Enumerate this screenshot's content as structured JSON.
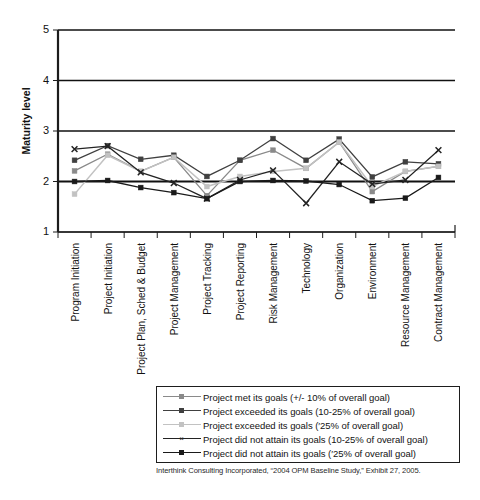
{
  "chart_data": {
    "type": "line",
    "title": "",
    "xlabel": "",
    "ylabel": "Maturity level",
    "ylim": [
      1,
      5
    ],
    "yticks": [
      1,
      2,
      3,
      4,
      5
    ],
    "grid": true,
    "grid_axis": "y",
    "legend_position": "below-plot",
    "categories": [
      "Program Initiation",
      "Project Initiation",
      "Project Plan, Sched & Budget",
      "Project Management",
      "Project Tracking",
      "Project Reporting",
      "Risk Management",
      "Technology",
      "Organization",
      "Environment",
      "Resource Management",
      "Contract Management"
    ],
    "series": [
      {
        "name": "Project met its goals (+/- 10% of overall goal)",
        "color": "#8a8a8a",
        "marker": "square",
        "values": [
          2.21,
          2.54,
          2.2,
          2.48,
          1.72,
          2.42,
          2.62,
          2.26,
          2.78,
          1.8,
          2.2,
          2.3
        ]
      },
      {
        "name": "Project exceeded its goals (10-25% of overall goal)",
        "color": "#404040",
        "marker": "square",
        "values": [
          2.42,
          2.71,
          2.44,
          2.52,
          2.1,
          2.42,
          2.85,
          2.42,
          2.84,
          2.09,
          2.39,
          2.35
        ]
      },
      {
        "name": "Project exceeded its goals (>25% of overall goal)",
        "color": "#c2c2c2",
        "marker": "square",
        "values": [
          1.75,
          2.52,
          2.2,
          2.48,
          1.9,
          2.1,
          2.2,
          2.26,
          2.78,
          1.9,
          2.2,
          2.3
        ]
      },
      {
        "name": "Project did not attain its goals (10-25% of overall goal)",
        "color": "#232323",
        "marker": "x",
        "values": [
          2.64,
          2.7,
          2.18,
          1.97,
          1.66,
          2.03,
          2.22,
          1.57,
          2.39,
          1.95,
          2.03,
          2.62
        ]
      },
      {
        "name": "Project did not attain its goals (>25% of overall goal)",
        "color": "#1a1a1a",
        "marker": "square",
        "values": [
          2.0,
          2.02,
          1.88,
          1.78,
          1.66,
          2.0,
          2.02,
          2.01,
          1.94,
          1.62,
          1.67,
          2.08
        ]
      }
    ]
  },
  "legend": {
    "items": [
      {
        "label": "Project met its goals (+/- 10% of overall goal)",
        "color": "#8a8a8a",
        "marker": "square"
      },
      {
        "label": "Project exceeded its goals (10-25% of overall goal)",
        "color": "#404040",
        "marker": "square"
      },
      {
        "label": "Project exceeded its goals (′25% of overall goal)",
        "color": "#c2c2c2",
        "marker": "square"
      },
      {
        "label": "Project did not attain its goals (10-25% of overall goal)",
        "color": "#232323",
        "marker": "x"
      },
      {
        "label": "Project did not attain its goals (′25% of overall goal)",
        "color": "#1a1a1a",
        "marker": "square"
      }
    ]
  },
  "source_caption": "Interthink Consulting Incorporated, “2004 OPM Baseline Study,” Exhibit 27, 2005."
}
